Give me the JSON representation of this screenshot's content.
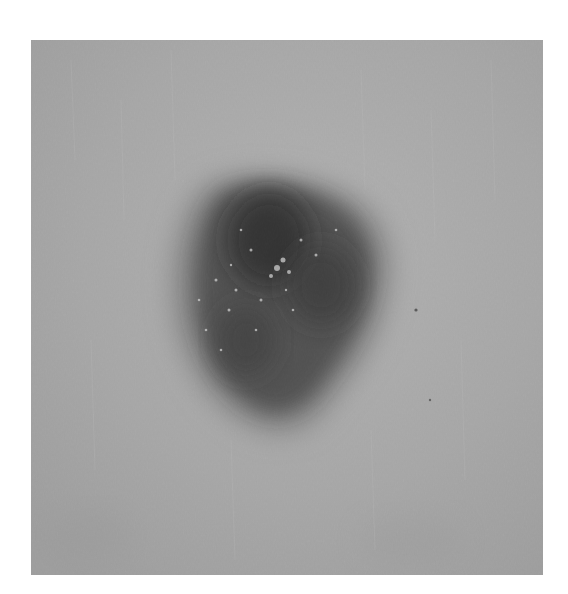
{
  "image": {
    "subject": "dark pigmented skin lesion on lighter skin, grayscale photograph",
    "colors": {
      "background_border": "#ffffff",
      "skin": "#a9a9a9",
      "skin_light": "#b8b8b8",
      "lesion_edge": "#6e6e6e",
      "lesion_mid": "#3e3e3e",
      "lesion_core": "#1c1c1c",
      "speckle": "#d8d8d8"
    }
  }
}
